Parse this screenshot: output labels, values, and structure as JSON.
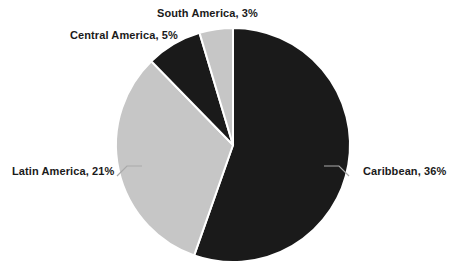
{
  "chart_data": {
    "type": "pie",
    "title": "",
    "categories": [
      "Caribbean",
      "Latin America",
      "Central America",
      "South America"
    ],
    "values": [
      36,
      21,
      5,
      3
    ],
    "value_unit": "%",
    "labels": [
      "Caribbean, 36%",
      "Latin America, 21%",
      "Central America, 5%",
      "South America, 3%"
    ],
    "colors": [
      "#1a1a1a",
      "#c6c6c6",
      "#1a1a1a",
      "#c6c6c6"
    ],
    "legend": "none",
    "legend_position": "none",
    "label_placement": "outside",
    "grid": false,
    "start_angle_deg": 0,
    "direction": "clockwise",
    "separator_color": "#ffffff"
  },
  "chart": {
    "slices": [
      {
        "name": "Caribbean",
        "label": "Caribbean, 36%",
        "value": 36,
        "percent_text": "36%",
        "color": "#1a1a1a",
        "start_deg": 0,
        "end_deg": 199.4
      },
      {
        "name": "Latin America",
        "label": "Latin America, 21%",
        "value": 21,
        "percent_text": "21%",
        "color": "#c6c6c6",
        "start_deg": 199.4,
        "end_deg": 315.4
      },
      {
        "name": "Central America",
        "label": "Central America, 5%",
        "value": 5,
        "percent_text": "5%",
        "color": "#1a1a1a",
        "start_deg": 315.4,
        "end_deg": 343.1
      },
      {
        "name": "South America",
        "label": "South America, 3%",
        "value": 3,
        "percent_text": "3%",
        "color": "#c6c6c6",
        "start_deg": 343.1,
        "end_deg": 360
      }
    ],
    "geometry": {
      "center_x": 233,
      "center_y": 145,
      "radius": 117
    },
    "leader_line_color": "#a9a9a9"
  }
}
